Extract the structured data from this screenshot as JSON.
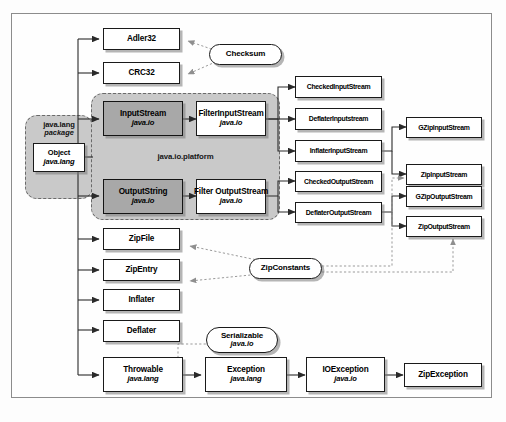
{
  "diagram": {
    "type": "uml-class-diagram",
    "colors": {
      "background": "#fdfdfd",
      "frame_border": "#8c8c8c",
      "node_border": "#1a1a1a",
      "node_fill": "#ffffff",
      "shaded_fill": "#a8a8a8",
      "package_fill": "#c9c9c9",
      "package_border": "#6a6a6a",
      "connector": "#333333",
      "dotted_connector": "#9a9a9a"
    },
    "packages": [
      {
        "id": "java-lang-package",
        "line1": "java.lang",
        "line2": "package"
      },
      {
        "id": "java-io-platform",
        "label": "java.io.platform"
      }
    ],
    "nodes": [
      {
        "id": "object",
        "name": "Object",
        "pkg": "java.lang",
        "style": "plain"
      },
      {
        "id": "adler32",
        "name": "Adler32",
        "pkg": "",
        "style": "plain"
      },
      {
        "id": "crc32",
        "name": "CRC32",
        "pkg": "",
        "style": "plain"
      },
      {
        "id": "input-stream",
        "name": "InputStream",
        "pkg": "java.io",
        "style": "shaded"
      },
      {
        "id": "output-string",
        "name": "OutputString",
        "pkg": "java.io",
        "style": "shaded"
      },
      {
        "id": "filter-input-stream",
        "name": "FilterInputStream",
        "pkg": "java.io",
        "style": "plain"
      },
      {
        "id": "filter-output-stream",
        "name": "Filter OutputStream",
        "pkg": "java.io",
        "style": "plain"
      },
      {
        "id": "checked-input-stream",
        "name": "CheckedInputStream",
        "pkg": "",
        "style": "plain"
      },
      {
        "id": "deflater-input-stream",
        "name": "DeflaterInputstream",
        "pkg": "",
        "style": "plain"
      },
      {
        "id": "inflater-input-stream",
        "name": "InflaterInputStream",
        "pkg": "",
        "style": "plain"
      },
      {
        "id": "checked-output-stream",
        "name": "CheckedOutputStream",
        "pkg": "",
        "style": "plain"
      },
      {
        "id": "deflater-output-stream",
        "name": "DeflaterOutputStream",
        "pkg": "",
        "style": "plain"
      },
      {
        "id": "gzip-input-stream",
        "name": "GZipInputStream",
        "pkg": "",
        "style": "plain"
      },
      {
        "id": "zip-input-stream",
        "name": "ZipInputStream",
        "pkg": "",
        "style": "plain"
      },
      {
        "id": "gzip-output-stream",
        "name": "GZipOutputStream",
        "pkg": "",
        "style": "plain"
      },
      {
        "id": "zip-output-stream",
        "name": "ZipOutputStream",
        "pkg": "",
        "style": "plain"
      },
      {
        "id": "zip-file",
        "name": "ZipFile",
        "pkg": "",
        "style": "plain"
      },
      {
        "id": "zip-entry",
        "name": "ZipEntry",
        "pkg": "",
        "style": "plain"
      },
      {
        "id": "inflater",
        "name": "Inflater",
        "pkg": "",
        "style": "plain"
      },
      {
        "id": "deflater",
        "name": "Deflater",
        "pkg": "",
        "style": "plain"
      },
      {
        "id": "throwable",
        "name": "Throwable",
        "pkg": "java.lang",
        "style": "plain"
      },
      {
        "id": "exception",
        "name": "Exception",
        "pkg": "java.lang",
        "style": "plain"
      },
      {
        "id": "io-exception",
        "name": "IOException",
        "pkg": "java.io",
        "style": "plain"
      },
      {
        "id": "zip-exception",
        "name": "ZipException",
        "pkg": "",
        "style": "plain"
      }
    ],
    "interfaces": [
      {
        "id": "checksum",
        "name": "Checksum",
        "pkg": ""
      },
      {
        "id": "zip-constants",
        "name": "ZipConstants",
        "pkg": ""
      },
      {
        "id": "serializable",
        "name": "Serializable",
        "pkg": "java.io"
      }
    ]
  }
}
